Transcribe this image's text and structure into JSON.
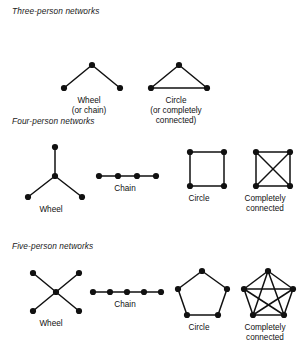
{
  "figure": {
    "background_color": "#ffffff",
    "ink_color": "#111111",
    "node_color": "#111111"
  },
  "sections": [
    {
      "id": "three-person",
      "title": "Three-person networks",
      "items": [
        {
          "id": "three-wheel",
          "caption": "Wheel\n(or chain)",
          "graph_type": "wheel",
          "node_count": 3,
          "edge_count": 2,
          "nodes": [
            {
              "id": "n0",
              "x": 34,
              "y": 33
            },
            {
              "id": "n1",
              "x": 6,
              "y": 56
            },
            {
              "id": "n2",
              "x": 62,
              "y": 56
            }
          ],
          "edges": [
            [
              "n0",
              "n1"
            ],
            [
              "n0",
              "n2"
            ]
          ],
          "label_x": 47,
          "label_width": 84
        },
        {
          "id": "three-circle",
          "caption": "Circle\n(or completely\nconnected)",
          "graph_type": "circle",
          "node_count": 3,
          "edge_count": 3,
          "nodes": [
            {
              "id": "n0",
              "x": 34,
              "y": 33
            },
            {
              "id": "n1",
              "x": 6,
              "y": 56
            },
            {
              "id": "n2",
              "x": 62,
              "y": 56
            }
          ],
          "edges": [
            [
              "n0",
              "n1"
            ],
            [
              "n0",
              "n2"
            ],
            [
              "n1",
              "n2"
            ]
          ],
          "label_x": 131,
          "label_width": 90
        }
      ]
    },
    {
      "id": "four-person",
      "title": "Four-person networks",
      "items": [
        {
          "id": "four-wheel",
          "caption": "Wheel",
          "graph_type": "wheel",
          "node_count": 4,
          "edge_count": 3,
          "nodes": [
            {
              "id": "c",
              "x": 34,
              "y": 33
            },
            {
              "id": "n0",
              "x": 34,
              "y": 4
            },
            {
              "id": "n1",
              "x": 7,
              "y": 54
            },
            {
              "id": "n2",
              "x": 61,
              "y": 54
            }
          ],
          "edges": [
            [
              "c",
              "n0"
            ],
            [
              "c",
              "n1"
            ],
            [
              "c",
              "n2"
            ]
          ],
          "label_x": 9,
          "label_width": 84
        },
        {
          "id": "four-chain",
          "caption": "Chain",
          "graph_type": "chain",
          "node_count": 4,
          "edge_count": 3,
          "nodes": [
            {
              "id": "n0",
              "x": 4,
              "y": 33
            },
            {
              "id": "n1",
              "x": 23,
              "y": 33
            },
            {
              "id": "n2",
              "x": 42,
              "y": 33
            },
            {
              "id": "n3",
              "x": 61,
              "y": 33
            }
          ],
          "edges": [
            [
              "n0",
              "n1"
            ],
            [
              "n1",
              "n2"
            ],
            [
              "n2",
              "n3"
            ]
          ],
          "label_x": 83,
          "label_width": 84
        },
        {
          "id": "four-circle",
          "caption": "Circle",
          "graph_type": "circle",
          "node_count": 4,
          "edge_count": 4,
          "nodes": [
            {
              "id": "n0",
              "x": 16,
              "y": 9
            },
            {
              "id": "n1",
              "x": 50,
              "y": 9
            },
            {
              "id": "n2",
              "x": 50,
              "y": 43
            },
            {
              "id": "n3",
              "x": 16,
              "y": 43
            }
          ],
          "edges": [
            [
              "n0",
              "n1"
            ],
            [
              "n1",
              "n2"
            ],
            [
              "n2",
              "n3"
            ],
            [
              "n3",
              "n0"
            ]
          ],
          "label_x": 157,
          "label_width": 84
        },
        {
          "id": "four-complete",
          "caption": "Completely\nconnected",
          "graph_type": "complete",
          "node_count": 4,
          "edge_count": 6,
          "nodes": [
            {
              "id": "n0",
              "x": 16,
              "y": 9
            },
            {
              "id": "n1",
              "x": 50,
              "y": 9
            },
            {
              "id": "n2",
              "x": 50,
              "y": 43
            },
            {
              "id": "n3",
              "x": 16,
              "y": 43
            }
          ],
          "edges": [
            [
              "n0",
              "n1"
            ],
            [
              "n1",
              "n2"
            ],
            [
              "n2",
              "n3"
            ],
            [
              "n3",
              "n0"
            ],
            [
              "n0",
              "n2"
            ],
            [
              "n1",
              "n3"
            ]
          ],
          "label_x": 225,
          "label_width": 80
        }
      ]
    },
    {
      "id": "five-person",
      "title": "Five-person networks",
      "items": [
        {
          "id": "five-wheel",
          "caption": "Wheel",
          "graph_type": "wheel",
          "node_count": 5,
          "edge_count": 4,
          "nodes": [
            {
              "id": "c",
              "x": 33,
              "y": 24
            },
            {
              "id": "n0",
              "x": 10,
              "y": 5
            },
            {
              "id": "n1",
              "x": 56,
              "y": 5
            },
            {
              "id": "n2",
              "x": 10,
              "y": 43
            },
            {
              "id": "n3",
              "x": 56,
              "y": 43
            }
          ],
          "edges": [
            [
              "c",
              "n0"
            ],
            [
              "c",
              "n1"
            ],
            [
              "c",
              "n2"
            ],
            [
              "c",
              "n3"
            ]
          ],
          "label_x": 9,
          "label_width": 84
        },
        {
          "id": "five-chain",
          "caption": "Chain",
          "graph_type": "chain",
          "node_count": 5,
          "edge_count": 4,
          "nodes": [
            {
              "id": "n0",
              "x": 4,
              "y": 24
            },
            {
              "id": "n1",
              "x": 21,
              "y": 24
            },
            {
              "id": "n2",
              "x": 38,
              "y": 24
            },
            {
              "id": "n3",
              "x": 55,
              "y": 24
            },
            {
              "id": "n4",
              "x": 72,
              "y": 24
            }
          ],
          "edges": [
            [
              "n0",
              "n1"
            ],
            [
              "n1",
              "n2"
            ],
            [
              "n2",
              "n3"
            ],
            [
              "n3",
              "n4"
            ]
          ],
          "label_x": 83,
          "label_width": 84
        },
        {
          "id": "five-circle",
          "caption": "Circle",
          "graph_type": "circle",
          "node_count": 5,
          "edge_count": 5,
          "nodes": [
            {
              "id": "n0",
              "x": 31,
              "y": 3
            },
            {
              "id": "n1",
              "x": 56,
              "y": 21
            },
            {
              "id": "n2",
              "x": 47,
              "y": 47
            },
            {
              "id": "n3",
              "x": 16,
              "y": 47
            },
            {
              "id": "n4",
              "x": 7,
              "y": 21
            }
          ],
          "edges": [
            [
              "n0",
              "n1"
            ],
            [
              "n1",
              "n2"
            ],
            [
              "n2",
              "n3"
            ],
            [
              "n3",
              "n4"
            ],
            [
              "n4",
              "n0"
            ]
          ],
          "label_x": 157,
          "label_width": 84
        },
        {
          "id": "five-complete",
          "caption": "Completely\nconnected",
          "graph_type": "complete",
          "node_count": 5,
          "edge_count": 10,
          "nodes": [
            {
              "id": "n0",
              "x": 31,
              "y": 3
            },
            {
              "id": "n1",
              "x": 56,
              "y": 21
            },
            {
              "id": "n2",
              "x": 47,
              "y": 47
            },
            {
              "id": "n3",
              "x": 16,
              "y": 47
            },
            {
              "id": "n4",
              "x": 7,
              "y": 21
            }
          ],
          "edges": [
            [
              "n0",
              "n1"
            ],
            [
              "n1",
              "n2"
            ],
            [
              "n2",
              "n3"
            ],
            [
              "n3",
              "n4"
            ],
            [
              "n4",
              "n0"
            ],
            [
              "n0",
              "n2"
            ],
            [
              "n0",
              "n3"
            ],
            [
              "n1",
              "n3"
            ],
            [
              "n1",
              "n4"
            ],
            [
              "n2",
              "n4"
            ]
          ],
          "label_x": 225,
          "label_width": 80
        }
      ]
    }
  ]
}
